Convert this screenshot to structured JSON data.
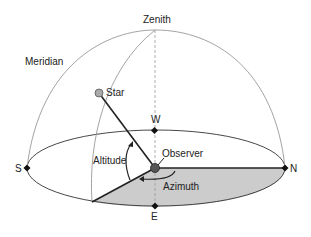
{
  "diagram": {
    "type": "horizontal-coordinate-system",
    "labels": {
      "zenith": "Zenith",
      "meridian": "Meridian",
      "star": "Star",
      "west": "W",
      "south": "S",
      "north": "N",
      "east": "E",
      "observer": "Observer",
      "altitude": "Altitude",
      "azimuth": "Azimuth"
    },
    "colors": {
      "line": "#888888",
      "bold_line": "#222222",
      "shade": "#cccccc",
      "star_fill": "#aaaaaa",
      "observer_fill": "#555555",
      "text": "#222222"
    }
  }
}
